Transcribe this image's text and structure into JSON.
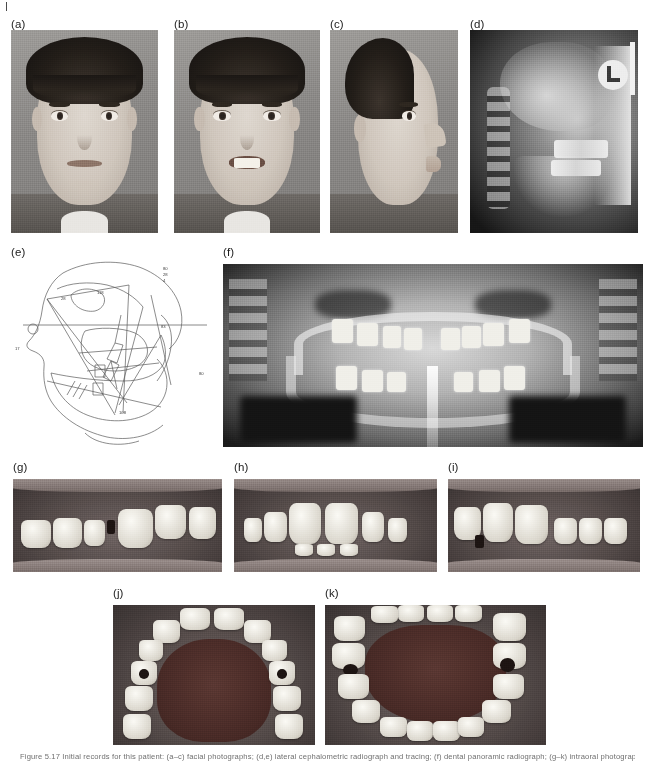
{
  "page": {
    "background_color": "#ffffff",
    "crop_mark": "crop-tick"
  },
  "panels": [
    {
      "id": "a",
      "label": "(a)",
      "type": "clinical-photograph",
      "description": "Frontal facial photograph, lips at rest",
      "label_x": 11,
      "label_y": 19,
      "x": 11,
      "y": 30,
      "w": 147,
      "h": 203
    },
    {
      "id": "b",
      "label": "(b)",
      "type": "clinical-photograph",
      "description": "Frontal facial photograph, smiling",
      "label_x": 174,
      "label_y": 19,
      "x": 174,
      "y": 30,
      "w": 146,
      "h": 203
    },
    {
      "id": "c",
      "label": "(c)",
      "type": "clinical-photograph",
      "description": "Profile facial photograph",
      "label_x": 330,
      "label_y": 19,
      "x": 330,
      "y": 30,
      "w": 128,
      "h": 203
    },
    {
      "id": "d",
      "label": "(d)",
      "type": "radiograph",
      "description": "Lateral cephalometric radiograph",
      "label_x": 470,
      "label_y": 19,
      "x": 470,
      "y": 30,
      "w": 168,
      "h": 203
    },
    {
      "id": "e",
      "label": "(e)",
      "type": "cephalometric-tracing",
      "description": "Cephalometric tracing with angular measurements",
      "label_x": 11,
      "label_y": 247,
      "x": 11,
      "y": 262,
      "w": 205,
      "h": 185
    },
    {
      "id": "f",
      "label": "(f)",
      "type": "radiograph",
      "description": "Dental panoramic radiograph",
      "label_x": 223,
      "label_y": 247,
      "x": 223,
      "y": 264,
      "w": 420,
      "h": 183
    },
    {
      "id": "g",
      "label": "(g)",
      "type": "intraoral-photograph",
      "description": "Right buccal intraoral view",
      "label_x": 13,
      "label_y": 462,
      "x": 13,
      "y": 479,
      "w": 209,
      "h": 93
    },
    {
      "id": "h",
      "label": "(h)",
      "type": "intraoral-photograph",
      "description": "Frontal intraoral view in occlusion",
      "label_x": 234,
      "label_y": 462,
      "x": 234,
      "y": 479,
      "w": 203,
      "h": 93
    },
    {
      "id": "i",
      "label": "(i)",
      "type": "intraoral-photograph",
      "description": "Left buccal intraoral view",
      "label_x": 448,
      "label_y": 462,
      "x": 448,
      "y": 479,
      "w": 192,
      "h": 93
    },
    {
      "id": "j",
      "label": "(j)",
      "type": "intraoral-photograph",
      "description": "Maxillary occlusal intraoral view",
      "label_x": 113,
      "label_y": 588,
      "x": 113,
      "y": 605,
      "w": 202,
      "h": 140
    },
    {
      "id": "k",
      "label": "(k)",
      "type": "intraoral-photograph",
      "description": "Mandibular occlusal intraoral view",
      "label_x": 325,
      "label_y": 588,
      "x": 325,
      "y": 605,
      "w": 221,
      "h": 140
    }
  ],
  "ceph_tracing": {
    "measurements": [
      {
        "label": "80",
        "x": 163,
        "y": 268
      },
      {
        "label": "28",
        "x": 163,
        "y": 274
      },
      {
        "label": "4",
        "x": 163,
        "y": 280
      },
      {
        "label": "118",
        "x": 98,
        "y": 293
      },
      {
        "label": "28",
        "x": 63,
        "y": 299
      },
      {
        "label": "83",
        "x": 161,
        "y": 327
      },
      {
        "label": "17",
        "x": 15,
        "y": 349
      },
      {
        "label": "80",
        "x": 199,
        "y": 374
      },
      {
        "label": "108",
        "x": 120,
        "y": 413
      }
    ],
    "frankfort_line": {
      "x1": 22,
      "x2": 200,
      "y": 325
    }
  },
  "cephalogram_marker": {
    "letter": "L"
  },
  "caption": {
    "text": "Figure 5.17  Initial records for this patient: (a–c) facial photographs; (d,e) lateral cephalometric radiograph and tracing; (f) dental panoramic radiograph; (g–k) intraoral photographs."
  }
}
